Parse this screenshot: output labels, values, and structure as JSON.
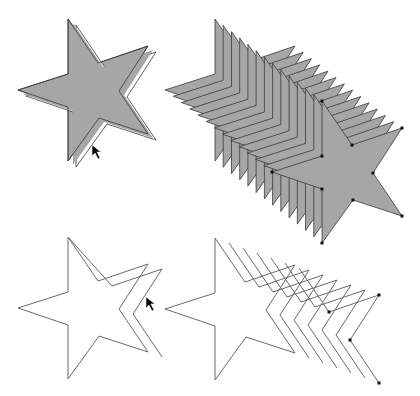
{
  "colors": {
    "background": "#ffffff",
    "fill": "#a6a6a6",
    "stroke": "#3a3a3a",
    "outline": "#6a6a6a",
    "node": "#111111"
  },
  "star_shape": [
    [
      0,
      0
    ],
    [
      30,
      44
    ],
    [
      80,
      27
    ],
    [
      51,
      72
    ],
    [
      80,
      115
    ],
    [
      31,
      99
    ],
    [
      0,
      142
    ],
    [
      0,
      88
    ],
    [
      -50,
      71
    ],
    [
      0,
      55
    ]
  ],
  "panels": [
    {
      "name": "filled-star-duplicate",
      "type": "filled",
      "stars": [
        {
          "x": 76,
          "y": 25,
          "fill": "#ffffff",
          "scaleRight": [
            1.1,
            1.0
          ]
        },
        {
          "x": 68,
          "y": 19,
          "fill": "#a6a6a6"
        }
      ],
      "cursor": {
        "x": 92,
        "y": 145
      }
    },
    {
      "name": "filled-star-blend",
      "type": "filled-stack",
      "start": {
        "x": 215,
        "y": 19
      },
      "step": {
        "dx": 8.23,
        "dy": 6.31
      },
      "count": 14,
      "show_nodes_on_front": true
    },
    {
      "name": "outline-star-duplicate",
      "type": "outline",
      "stars": [
        {
          "x": 68,
          "y": 237
        },
        {
          "x": 68,
          "y": 237,
          "partial_shift": {
            "dx": 14,
            "dy": 5
          }
        }
      ],
      "cursor": {
        "x": 146,
        "y": 297
      }
    },
    {
      "name": "outline-star-blend",
      "type": "outline-stack",
      "start": {
        "x": 215,
        "y": 238
      },
      "step": {
        "dx": 14,
        "dy": 5
      },
      "count": 7,
      "show_nodes_on_last": true
    }
  ]
}
